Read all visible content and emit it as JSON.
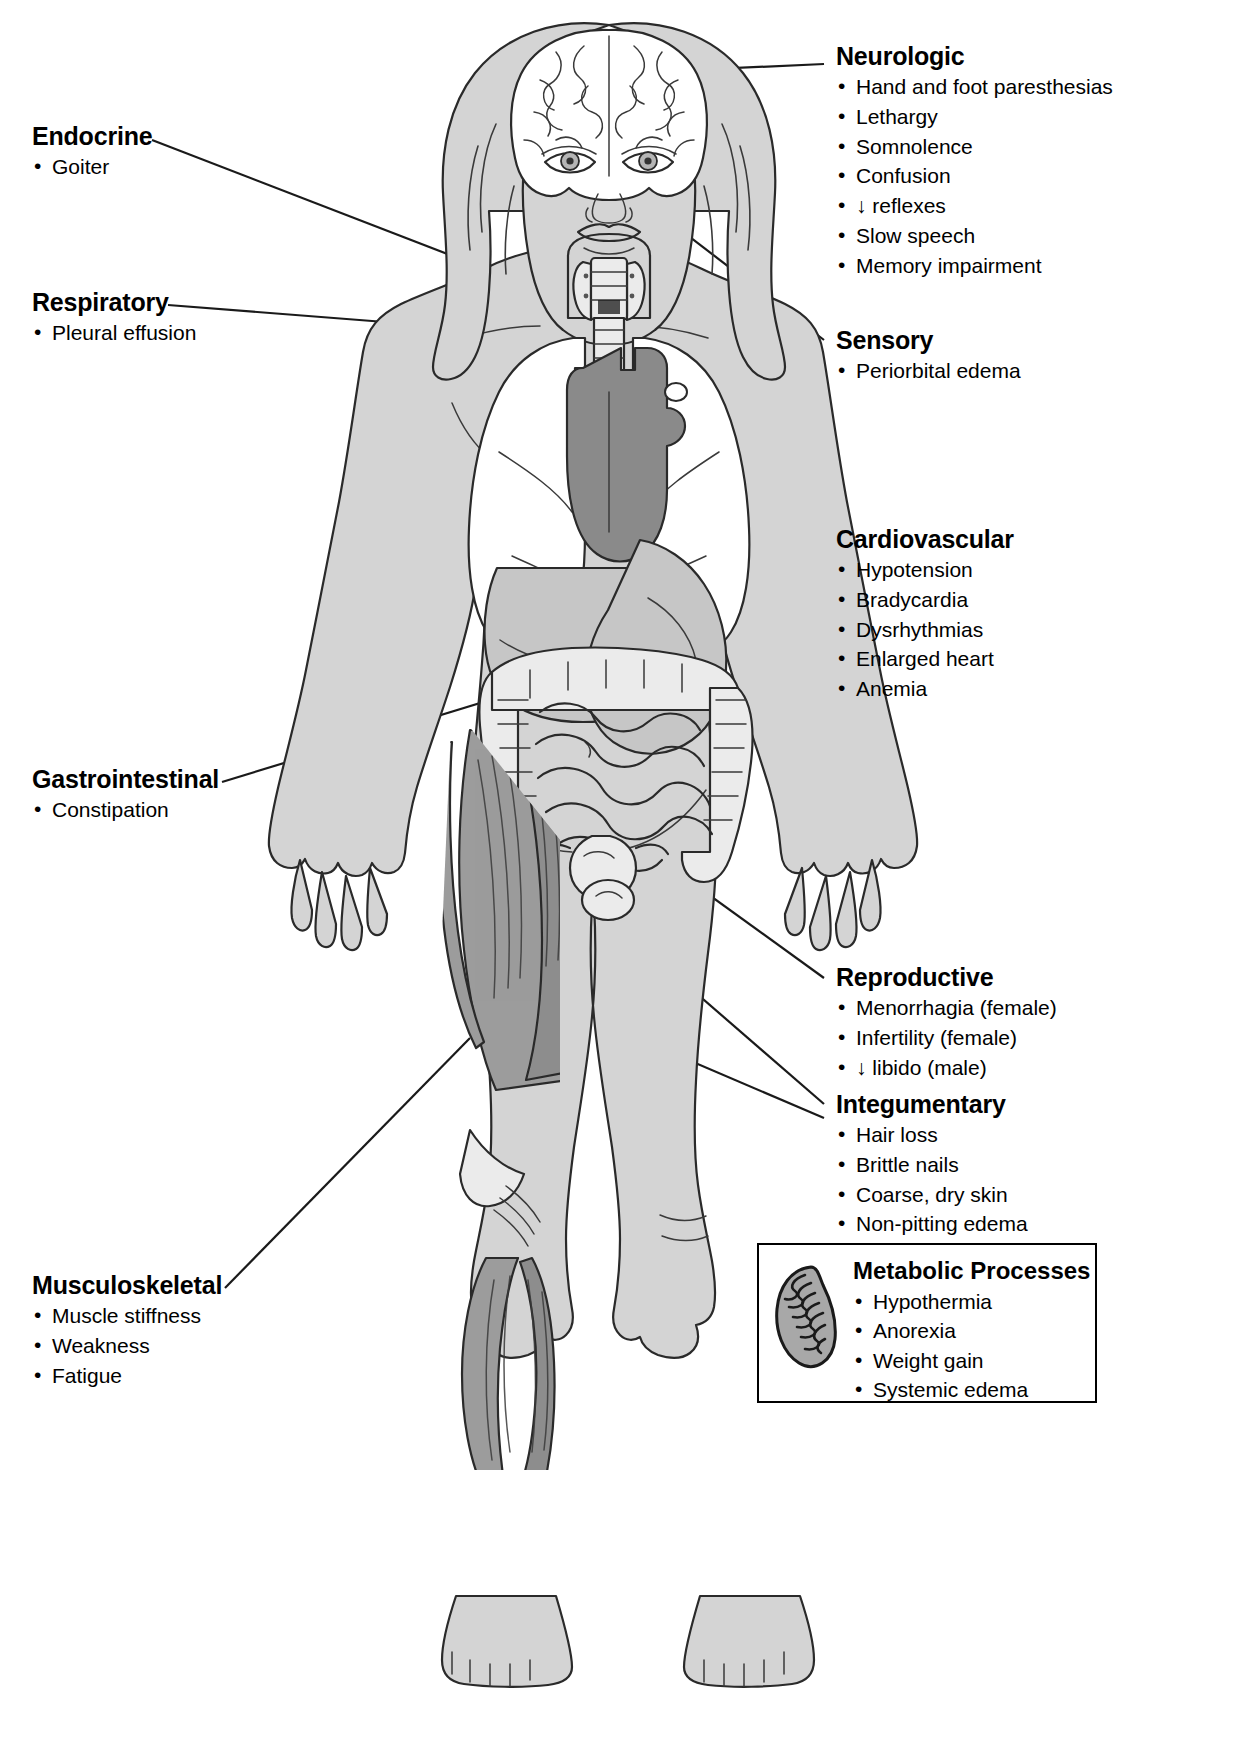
{
  "diagram": {
    "figure_label": "female-anatomical-figure"
  },
  "callouts": [
    {
      "id": "endocrine",
      "title": "Endocrine",
      "items": [
        "Goiter"
      ],
      "side": "left"
    },
    {
      "id": "respiratory",
      "title": "Respiratory",
      "items": [
        "Pleural effusion"
      ],
      "side": "left"
    },
    {
      "id": "gastrointestinal",
      "title": "Gastrointestinal",
      "items": [
        "Constipation"
      ],
      "side": "left"
    },
    {
      "id": "musculoskeletal",
      "title": "Musculoskeletal",
      "items": [
        "Muscle stiffness",
        "Weakness",
        "Fatigue"
      ],
      "side": "left"
    },
    {
      "id": "neurologic",
      "title": "Neurologic",
      "items": [
        "Hand and foot paresthesias",
        "Lethargy",
        "Somnolence",
        "Confusion",
        "↓ reflexes",
        "Slow speech",
        "Memory impairment"
      ],
      "side": "right"
    },
    {
      "id": "sensory",
      "title": "Sensory",
      "items": [
        "Periorbital edema"
      ],
      "side": "right"
    },
    {
      "id": "cardiovascular",
      "title": "Cardiovascular",
      "items": [
        "Hypotension",
        "Bradycardia",
        "Dysrhythmias",
        "Enlarged heart",
        "Anemia"
      ],
      "side": "right"
    },
    {
      "id": "reproductive",
      "title": "Reproductive",
      "items": [
        "Menorrhagia (female)",
        "Infertility (female)",
        "↓ libido (male)"
      ],
      "side": "right"
    },
    {
      "id": "integumentary",
      "title": "Integumentary",
      "items": [
        "Hair loss",
        "Brittle nails",
        "Coarse, dry skin",
        "Non-pitting edema"
      ],
      "side": "right"
    }
  ],
  "metabolic_box": {
    "title": "Metabolic Processes",
    "icon": "mitochondrion-icon",
    "items": [
      "Hypothermia",
      "Anorexia",
      "Weight gain",
      "Systemic edema"
    ]
  },
  "colors": {
    "ink": "#1a1a1a",
    "skin": "#d4d4d4",
    "skin_shade": "#c2c2c2",
    "organ_light": "#e8e8e8",
    "organ_white": "#ffffff",
    "heart_dark": "#8a8a8a",
    "muscle": "#9a9a9a",
    "muscle_dark": "#8c8c8c",
    "box_border": "#000000",
    "background": "#ffffff"
  }
}
